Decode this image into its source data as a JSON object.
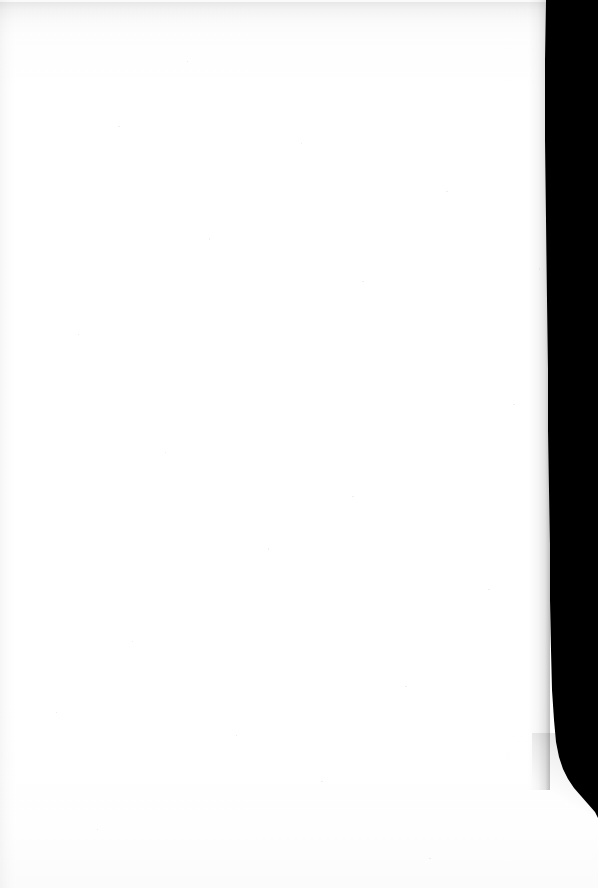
{
  "document": {
    "kind": "scanned-page",
    "title": "Blank scanned page",
    "page_state": "blank",
    "visible_text": "",
    "body_text_lines": [],
    "page_number": "",
    "header_text": "",
    "footer_text": "",
    "annotations": [],
    "notes": "No printed or handwritten text is visible anywhere on this page."
  },
  "canvas": {
    "width_px": 598,
    "height_px": 888,
    "paper_color": "#ffffff",
    "background_color": "#ffffff"
  },
  "artifacts": {
    "gutter_shadow": {
      "name": "right-edge scanner gutter shadow",
      "color": "#000000",
      "side": "right",
      "top_boundary_x_px": 546,
      "mid_boundary_x_px": 550,
      "curve_start_y_px": 760,
      "curve_exit_y_px": 818,
      "max_width_px": 60
    },
    "top_edge_line": {
      "name": "top hairline rule",
      "color": "#141414",
      "height_px": 3
    },
    "bottom_edge_line": {
      "name": "bottom hairline rule",
      "color": "#0d0d0d",
      "height_px": 4
    },
    "left_margin_band": {
      "name": "left margin tone band",
      "color": "#f2f2f2",
      "width_px": 16
    },
    "top_smudge": {
      "name": "upper gray shading band",
      "color": "#ededed",
      "height_px": 34
    }
  }
}
